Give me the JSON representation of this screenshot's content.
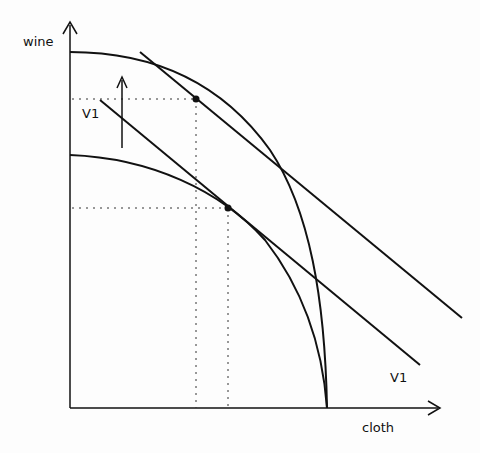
{
  "diagram": {
    "axes": {
      "y_label": "wine",
      "x_label": "cloth"
    },
    "labels": {
      "shift_label": "V1",
      "line_label": "V1"
    },
    "colors": {
      "stroke": "#111111",
      "background": "#fdfdfd"
    },
    "elements": [
      "outer production possibility frontier",
      "inner production possibility frontier",
      "upper price/value line tangent to outer frontier",
      "lower price/value line V1 tangent to inner frontier",
      "upward arrow indicating shift",
      "two tangency points with dotted projections to axes"
    ]
  }
}
